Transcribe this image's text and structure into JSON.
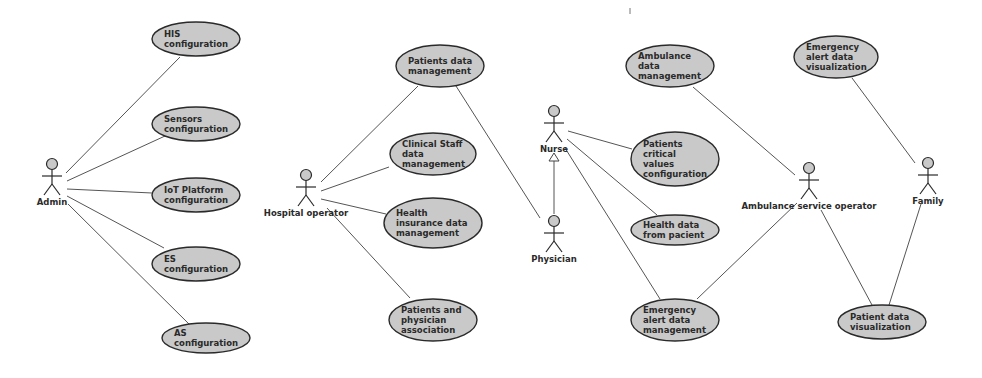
{
  "diagram": {
    "type": "UML use case diagram",
    "actors": [
      {
        "id": "admin",
        "label": "Admin",
        "x": 52,
        "y": 164
      },
      {
        "id": "hospital_operator",
        "label": "Hospital operator",
        "x": 306,
        "y": 175
      },
      {
        "id": "nurse",
        "label": "Nurse",
        "x": 554,
        "y": 111
      },
      {
        "id": "physician",
        "label": "Physician",
        "x": 554,
        "y": 221
      },
      {
        "id": "ambulance_service_operator",
        "label": "Ambulance service operator",
        "x": 809,
        "y": 168
      },
      {
        "id": "family",
        "label": "Family",
        "x": 928,
        "y": 163
      }
    ],
    "use_cases": [
      {
        "id": "his_config",
        "lines": [
          "HIS",
          "configuration"
        ],
        "cx": 196,
        "cy": 39,
        "rx": 44,
        "ry": 17
      },
      {
        "id": "sensors_config",
        "lines": [
          "Sensors",
          "configuration"
        ],
        "cx": 196,
        "cy": 124,
        "rx": 44,
        "ry": 17
      },
      {
        "id": "iot_config",
        "lines": [
          "IoT Platform",
          "configuration"
        ],
        "cx": 196,
        "cy": 195,
        "rx": 44,
        "ry": 17
      },
      {
        "id": "es_config",
        "lines": [
          "ES",
          "configuration"
        ],
        "cx": 196,
        "cy": 264,
        "rx": 44,
        "ry": 17
      },
      {
        "id": "as_config",
        "lines": [
          "AS",
          "configuration"
        ],
        "cx": 206,
        "cy": 338,
        "rx": 44,
        "ry": 15
      },
      {
        "id": "patients_data_mgmt",
        "lines": [
          "Patients data",
          "management"
        ],
        "cx": 440,
        "cy": 66,
        "rx": 44,
        "ry": 21
      },
      {
        "id": "clinical_staff_mgmt",
        "lines": [
          "Clinical Staff",
          "data",
          "management"
        ],
        "cx": 433,
        "cy": 154,
        "rx": 43,
        "ry": 21
      },
      {
        "id": "health_insurance_mgmt",
        "lines": [
          "Health",
          "insurance data",
          "management"
        ],
        "cx": 433,
        "cy": 223,
        "rx": 49,
        "ry": 25
      },
      {
        "id": "patients_physician_assoc",
        "lines": [
          "Patients and",
          "physician",
          "association"
        ],
        "cx": 433,
        "cy": 320,
        "rx": 44,
        "ry": 21
      },
      {
        "id": "ambulance_data_mgmt",
        "lines": [
          "Ambulance",
          "data",
          "management"
        ],
        "cx": 670,
        "cy": 66,
        "rx": 44,
        "ry": 21
      },
      {
        "id": "patients_critical_values",
        "lines": [
          "Patients",
          "critical",
          "values",
          "configuration"
        ],
        "cx": 675,
        "cy": 159,
        "rx": 44,
        "ry": 27
      },
      {
        "id": "health_data_from_patient",
        "lines": [
          "Health data",
          "from pacient"
        ],
        "cx": 675,
        "cy": 230,
        "rx": 44,
        "ry": 15
      },
      {
        "id": "emergency_alert_mgmt",
        "lines": [
          "Emergency",
          "alert data",
          "management"
        ],
        "cx": 675,
        "cy": 320,
        "rx": 44,
        "ry": 21
      },
      {
        "id": "emergency_alert_vis",
        "lines": [
          "Emergency",
          "alert data",
          "visualization"
        ],
        "cx": 836,
        "cy": 57,
        "rx": 42,
        "ry": 21
      },
      {
        "id": "patient_data_vis",
        "lines": [
          "Patient data",
          "visualization"
        ],
        "cx": 882,
        "cy": 322,
        "rx": 44,
        "ry": 17
      }
    ],
    "associations": [
      {
        "from": "admin",
        "to": "his_config",
        "x1": 66,
        "y1": 173,
        "x2": 180,
        "y2": 57
      },
      {
        "from": "admin",
        "to": "sensors_config",
        "x1": 67,
        "y1": 181,
        "x2": 165,
        "y2": 136
      },
      {
        "from": "admin",
        "to": "iot_config",
        "x1": 67,
        "y1": 189,
        "x2": 152,
        "y2": 193
      },
      {
        "from": "admin",
        "to": "es_config",
        "x1": 67,
        "y1": 196,
        "x2": 164,
        "y2": 248
      },
      {
        "from": "admin",
        "to": "as_config",
        "x1": 68,
        "y1": 204,
        "x2": 192,
        "y2": 327
      },
      {
        "from": "hospital_operator",
        "to": "patients_data_mgmt",
        "x1": 321,
        "y1": 182,
        "x2": 418,
        "y2": 86
      },
      {
        "from": "hospital_operator",
        "to": "clinical_staff_mgmt",
        "x1": 321,
        "y1": 191,
        "x2": 389,
        "y2": 167
      },
      {
        "from": "hospital_operator",
        "to": "health_insurance_mgmt",
        "x1": 321,
        "y1": 199,
        "x2": 386,
        "y2": 214
      },
      {
        "from": "hospital_operator",
        "to": "patients_physician_assoc",
        "x1": 327,
        "y1": 208,
        "x2": 410,
        "y2": 298
      },
      {
        "from": "physician",
        "to": "patients_data_mgmt",
        "x1": 540,
        "y1": 218,
        "x2": 456,
        "y2": 86
      },
      {
        "from": "nurse",
        "to": "patients_critical_values",
        "x1": 568,
        "y1": 131,
        "x2": 632,
        "y2": 149
      },
      {
        "from": "nurse",
        "to": "health_data_from_patient",
        "x1": 567,
        "y1": 139,
        "x2": 657,
        "y2": 215
      },
      {
        "from": "nurse",
        "to": "emergency_alert_mgmt",
        "x1": 565,
        "y1": 148,
        "x2": 660,
        "y2": 299
      },
      {
        "from": "ambulance_service_operator",
        "to": "ambulance_data_mgmt",
        "x1": 795,
        "y1": 175,
        "x2": 693,
        "y2": 87
      },
      {
        "from": "ambulance_service_operator",
        "to": "emergency_alert_mgmt",
        "x1": 797,
        "y1": 203,
        "x2": 697,
        "y2": 299
      },
      {
        "from": "ambulance_service_operator",
        "to": "patient_data_vis",
        "x1": 821,
        "y1": 210,
        "x2": 872,
        "y2": 305
      },
      {
        "from": "family",
        "to": "emergency_alert_vis",
        "x1": 915,
        "y1": 163,
        "x2": 852,
        "y2": 78
      },
      {
        "from": "family",
        "to": "patient_data_vis",
        "x1": 921,
        "y1": 204,
        "x2": 889,
        "y2": 305
      }
    ],
    "generalizations": [
      {
        "child": "physician",
        "parent": "nurse",
        "x": 554,
        "y_child": 214,
        "y_parent": 153
      }
    ],
    "colors": {
      "ellipse_fill": "#c9c9c9",
      "ellipse_stroke": "#2a2a2a",
      "line": "#555555",
      "background": "#ffffff"
    }
  }
}
